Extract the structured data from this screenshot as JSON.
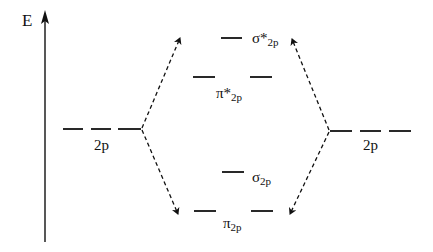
{
  "diagram": {
    "axis": {
      "label": "E",
      "direction": "up"
    },
    "atomic_orbitals": {
      "left": {
        "label": "2p",
        "count": 3
      },
      "right": {
        "label": "2p",
        "count": 3
      }
    },
    "molecular_orbitals": [
      {
        "id": "sigma_star_2p",
        "symbol": "σ*",
        "sub": "2p",
        "count": 1,
        "type": "antibonding"
      },
      {
        "id": "pi_star_2p",
        "symbol": "π*",
        "sub": "2p",
        "count": 2,
        "type": "antibonding"
      },
      {
        "id": "sigma_2p",
        "symbol": "σ",
        "sub": "2p",
        "count": 1,
        "type": "bonding"
      },
      {
        "id": "pi_2p",
        "symbol": "π",
        "sub": "2p",
        "count": 2,
        "type": "bonding"
      }
    ],
    "connectors": "dashed arrows from each 2p set to highest antibonding and lowest bonding levels",
    "colors": {
      "line": "#111111",
      "background": "#ffffff"
    }
  }
}
